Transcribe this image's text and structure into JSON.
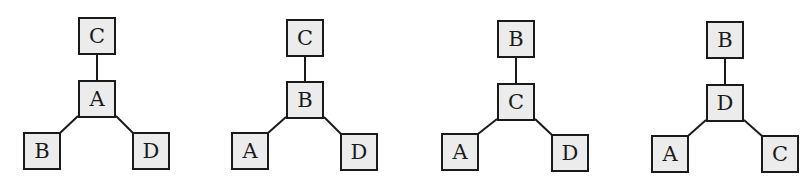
{
  "diagram": {
    "type": "tree-graphs",
    "style": {
      "node_fill": "#ececec",
      "node_border": "#1a1a1a",
      "edge_color": "#1a1a1a"
    },
    "graphs": [
      {
        "nodes": [
          {
            "id": "top",
            "label": "C",
            "x": 78,
            "y": 17
          },
          {
            "id": "center",
            "label": "A",
            "x": 78,
            "y": 80
          },
          {
            "id": "left",
            "label": "B",
            "x": 23,
            "y": 132
          },
          {
            "id": "right",
            "label": "D",
            "x": 132,
            "y": 132
          }
        ],
        "edges": [
          [
            "center",
            "top"
          ],
          [
            "center",
            "left"
          ],
          [
            "center",
            "right"
          ]
        ]
      },
      {
        "nodes": [
          {
            "id": "top",
            "label": "C",
            "x": 286,
            "y": 19
          },
          {
            "id": "center",
            "label": "B",
            "x": 286,
            "y": 81
          },
          {
            "id": "left",
            "label": "A",
            "x": 231,
            "y": 132
          },
          {
            "id": "right",
            "label": "D",
            "x": 340,
            "y": 133
          }
        ],
        "edges": [
          [
            "center",
            "top"
          ],
          [
            "center",
            "left"
          ],
          [
            "center",
            "right"
          ]
        ]
      },
      {
        "nodes": [
          {
            "id": "top",
            "label": "B",
            "x": 497,
            "y": 20
          },
          {
            "id": "center",
            "label": "C",
            "x": 497,
            "y": 83
          },
          {
            "id": "left",
            "label": "A",
            "x": 441,
            "y": 133
          },
          {
            "id": "right",
            "label": "D",
            "x": 551,
            "y": 134
          }
        ],
        "edges": [
          [
            "center",
            "top"
          ],
          [
            "center",
            "left"
          ],
          [
            "center",
            "right"
          ]
        ]
      },
      {
        "nodes": [
          {
            "id": "top",
            "label": "B",
            "x": 706,
            "y": 21
          },
          {
            "id": "center",
            "label": "D",
            "x": 706,
            "y": 84
          },
          {
            "id": "left",
            "label": "A",
            "x": 651,
            "y": 135
          },
          {
            "id": "right",
            "label": "C",
            "x": 761,
            "y": 135
          }
        ],
        "edges": [
          [
            "center",
            "top"
          ],
          [
            "center",
            "left"
          ],
          [
            "center",
            "right"
          ]
        ]
      }
    ]
  }
}
